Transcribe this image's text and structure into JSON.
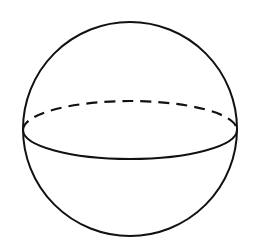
{
  "diagram": {
    "type": "geometric-figure",
    "colors": {
      "background": "#ffffff",
      "stroke": "#111111"
    },
    "sphere": {
      "cx": 130,
      "cy": 129,
      "r": 107
    },
    "equator": {
      "cx": 130,
      "cy": 130,
      "rx": 107,
      "ry": 29,
      "front_style": "solid",
      "back_style": "dashed"
    }
  }
}
